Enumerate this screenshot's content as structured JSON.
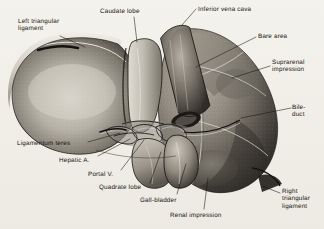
{
  "figure": {
    "style": "vintage-grayscale-engraving",
    "background_color": "#f1efe9",
    "ink_color": "#15120f",
    "width": 324,
    "height": 229
  },
  "labels": [
    {
      "id": "left-triangular-ligament",
      "text": "Left triangular\nligament",
      "x": 18,
      "y": 18,
      "align": "left"
    },
    {
      "id": "caudate-lobe",
      "text": "Caudate lobe",
      "x": 100,
      "y": 8,
      "align": "left"
    },
    {
      "id": "inferior-vena-cava",
      "text": "Inferior vena cava",
      "x": 198,
      "y": 6,
      "align": "left"
    },
    {
      "id": "bare-area",
      "text": "Bare area",
      "x": 258,
      "y": 33,
      "align": "left"
    },
    {
      "id": "suprarenal-impression",
      "text": "Suprarenal\nimpression",
      "x": 272,
      "y": 59,
      "align": "left"
    },
    {
      "id": "bile-duct",
      "text": "Bile-\nduct",
      "x": 292,
      "y": 104,
      "align": "left"
    },
    {
      "id": "ligamentum-teres",
      "text": "Ligamentum teres",
      "x": 17,
      "y": 140,
      "align": "left"
    },
    {
      "id": "hepatic-artery",
      "text": "Hepatic A.",
      "x": 59,
      "y": 157,
      "align": "left"
    },
    {
      "id": "portal-vein",
      "text": "Portal V.",
      "x": 88,
      "y": 171,
      "align": "left"
    },
    {
      "id": "quadrate-lobe",
      "text": "Quadrate lobe",
      "x": 99,
      "y": 184,
      "align": "left"
    },
    {
      "id": "gall-bladder",
      "text": "Gall-bladder",
      "x": 140,
      "y": 197,
      "align": "left"
    },
    {
      "id": "renal-impression",
      "text": "Renal impression",
      "x": 170,
      "y": 212,
      "align": "left"
    },
    {
      "id": "right-triangular-ligament",
      "text": "Right\ntriangular\nligament",
      "x": 282,
      "y": 188,
      "align": "left"
    }
  ],
  "leader_lines": [
    {
      "id": "leader-left-triangular-ligament",
      "points": "60,36 85,47"
    },
    {
      "id": "leader-caudate-lobe",
      "points": "134,17 137,42"
    },
    {
      "id": "leader-inferior-vena-cava",
      "points": "196,9 182,25"
    },
    {
      "id": "leader-bare-area",
      "points": "256,37 196,67"
    },
    {
      "id": "leader-suprarenal-impression",
      "points": "270,66 232,78"
    },
    {
      "id": "leader-bile-duct",
      "points": "291,108 241,118"
    },
    {
      "id": "leader-ligamentum-teres",
      "points": "88,142 120,133"
    },
    {
      "id": "leader-hepatic-artery",
      "points": "98,156 130,139"
    },
    {
      "id": "leader-portal-vein",
      "points": "121,170 144,140"
    },
    {
      "id": "leader-quadrate-lobe",
      "points": "150,183 161,152"
    },
    {
      "id": "leader-gall-bladder",
      "points": "177,194 186,164"
    },
    {
      "id": "leader-renal-impression",
      "points": "204,209 208,178"
    },
    {
      "id": "leader-right-triangular-ligament",
      "points": "280,193 262,186"
    }
  ]
}
